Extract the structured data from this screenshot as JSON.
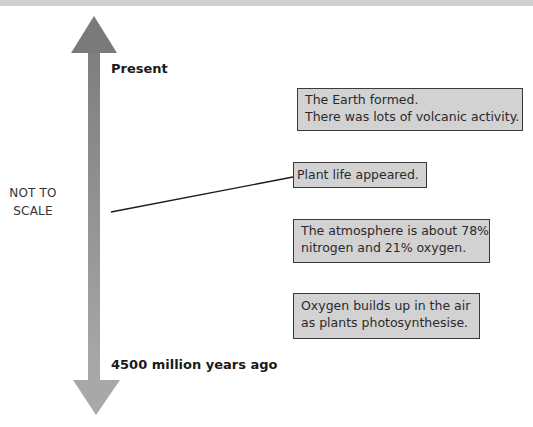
{
  "diagram": {
    "timeline": {
      "top_label": "Present",
      "bottom_label": "4500 million years ago",
      "scale_note_line1": "NOT TO",
      "scale_note_line2": "SCALE",
      "arrow_color": "#8c8c8c"
    },
    "boxes": [
      {
        "line1": "The Earth formed.",
        "line2": "There was lots of volcanic activity."
      },
      {
        "line1": "Plant life appeared.",
        "line2": ""
      },
      {
        "line1": "The atmosphere is about 78%",
        "line2": "nitrogen and 21% oxygen."
      },
      {
        "line1": "Oxygen builds up in the air",
        "line2": "as plants photosynthesise."
      }
    ],
    "colors": {
      "box_fill": "#d2d2d2",
      "box_border": "#3a3a3a",
      "top_band": "#cfcfcf"
    }
  }
}
